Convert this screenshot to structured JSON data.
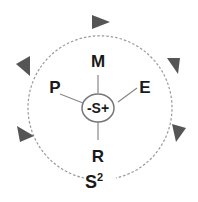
{
  "diagram": {
    "center_label": "-S+",
    "nodes": [
      {
        "id": "M",
        "label": "M",
        "position": "top"
      },
      {
        "id": "E",
        "label": "E",
        "position": "upper-right"
      },
      {
        "id": "R",
        "label": "R",
        "position": "bottom"
      },
      {
        "id": "P",
        "label": "P",
        "position": "upper-left"
      }
    ],
    "outer_label": "S",
    "outer_label_sup": "2",
    "cycle_direction": "clockwise",
    "colors": {
      "arrow": "#555555",
      "line": "#888888",
      "text": "#1a1a1a"
    }
  }
}
